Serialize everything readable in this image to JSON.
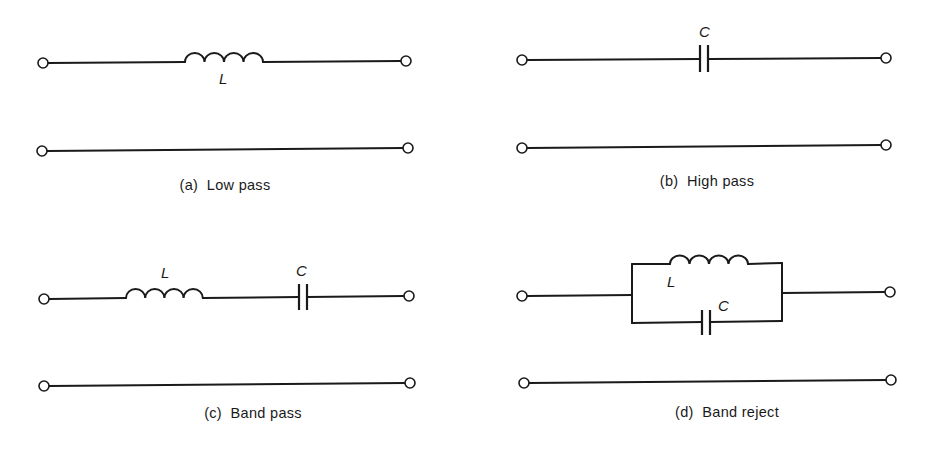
{
  "figure": {
    "panels": [
      {
        "id": "a",
        "caption": "(a)  Low pass",
        "components": [
          {
            "type": "inductor",
            "label": "L",
            "placement": "series"
          }
        ]
      },
      {
        "id": "b",
        "caption": "(b)  High pass",
        "components": [
          {
            "type": "capacitor",
            "label": "C",
            "placement": "series"
          }
        ]
      },
      {
        "id": "c",
        "caption": "(c)  Band pass",
        "components": [
          {
            "type": "inductor",
            "label": "L",
            "placement": "series"
          },
          {
            "type": "capacitor",
            "label": "C",
            "placement": "series"
          }
        ]
      },
      {
        "id": "d",
        "caption": "(d)  Band reject",
        "components": [
          {
            "type": "inductor",
            "label": "L",
            "placement": "parallel"
          },
          {
            "type": "capacitor",
            "label": "C",
            "placement": "parallel"
          }
        ]
      }
    ]
  },
  "colors": {
    "line": "#1a1a1a",
    "background": "#ffffff"
  }
}
